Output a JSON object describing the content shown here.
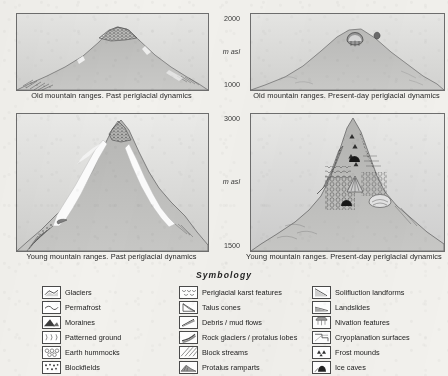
{
  "figure": {
    "axes": [
      {
        "id": "top",
        "top_label": "2000",
        "unit_label": "m asl",
        "bottom_label": "1000"
      },
      {
        "id": "bottom",
        "top_label": "3000",
        "unit_label": "m asl",
        "bottom_label": "1500"
      }
    ],
    "panels": [
      {
        "id": "old-past",
        "caption": "Old mountain ranges. Past periglacial dynamics"
      },
      {
        "id": "old-present",
        "caption": "Old mountain ranges. Present-day periglacial dynamics"
      },
      {
        "id": "young-past",
        "caption": "Young mountain ranges. Past periglacial dynamics"
      },
      {
        "id": "young-present",
        "caption": "Young mountain ranges. Present-day periglacial dynamics"
      }
    ]
  },
  "symbology": {
    "title": "Symbology",
    "columns": [
      {
        "id": "col-1",
        "items": [
          {
            "label": "Glaciers",
            "icon": "glaciers-swatch"
          },
          {
            "label": "Permafrost",
            "icon": "permafrost-swatch"
          },
          {
            "label": "Moraines",
            "icon": "moraines-swatch"
          },
          {
            "label": "Patterned ground",
            "icon": "patterned-ground-swatch"
          },
          {
            "label": "Earth hummocks",
            "icon": "earth-hummocks-swatch"
          },
          {
            "label": "Blockfields",
            "icon": "blockfields-swatch"
          }
        ]
      },
      {
        "id": "col-2",
        "items": [
          {
            "label": "Periglacial karst features",
            "icon": "periglacial-karst-swatch"
          },
          {
            "label": "Talus cones",
            "icon": "talus-cones-swatch"
          },
          {
            "label": "Debris / mud flows",
            "icon": "debris-mud-flows-swatch"
          },
          {
            "label": "Rock glaciers / protalus lobes",
            "icon": "rock-glaciers-swatch"
          },
          {
            "label": "Block streams",
            "icon": "block-streams-swatch"
          },
          {
            "label": "Protalus ramparts",
            "icon": "protalus-ramparts-swatch"
          }
        ]
      },
      {
        "id": "col-3",
        "items": [
          {
            "label": "Solifluction landforms",
            "icon": "solifluction-swatch"
          },
          {
            "label": "Landslides",
            "icon": "landslides-swatch"
          },
          {
            "label": "Nivation features",
            "icon": "nivation-swatch"
          },
          {
            "label": "Cryoplanation surfaces",
            "icon": "cryoplanation-swatch"
          },
          {
            "label": "Frost mounds",
            "icon": "frost-mounds-swatch"
          },
          {
            "label": "Ice caves",
            "icon": "ice-caves-swatch"
          }
        ]
      }
    ]
  },
  "colors": {
    "paper": "#f2f1ed",
    "panel_border": "#6e6e6e",
    "ink": "#262626",
    "snow": "#ffffff",
    "rock_dark": "#8f8f8f",
    "rock_light": "#cfcfcf"
  }
}
